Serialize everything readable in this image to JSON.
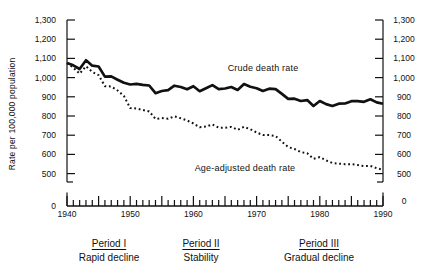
{
  "chart_data": {
    "type": "line",
    "title": "",
    "ylabel": "Rate per 100,000 population",
    "x_range": [
      1940,
      1990
    ],
    "years": [
      1940,
      1941,
      1942,
      1943,
      1944,
      1945,
      1946,
      1947,
      1948,
      1949,
      1950,
      1951,
      1952,
      1953,
      1954,
      1955,
      1956,
      1957,
      1958,
      1959,
      1960,
      1961,
      1962,
      1963,
      1964,
      1965,
      1966,
      1967,
      1968,
      1969,
      1970,
      1971,
      1972,
      1973,
      1974,
      1975,
      1976,
      1977,
      1978,
      1979,
      1980,
      1981,
      1982,
      1983,
      1984,
      1985,
      1986,
      1987,
      1988,
      1989,
      1990
    ],
    "series": [
      {
        "name": "Crude death rate",
        "style": "solid",
        "values": [
          1076,
          1064,
          1045,
          1090,
          1062,
          1058,
          1005,
          1006,
          989,
          973,
          964,
          967,
          962,
          959,
          919,
          930,
          935,
          958,
          951,
          939,
          955,
          929,
          945,
          961,
          940,
          943,
          951,
          936,
          966,
          952,
          945,
          930,
          942,
          940,
          915,
          889,
          890,
          878,
          883,
          852,
          878,
          862,
          852,
          864,
          865,
          877,
          877,
          874,
          887,
          871,
          864
        ]
      },
      {
        "name": "Age-adjusted death rate",
        "style": "dotted",
        "values": [
          1076,
          1052,
          1021,
          1059,
          1029,
          1013,
          955,
          954,
          933,
          904,
          841,
          839,
          831,
          824,
          785,
          789,
          786,
          798,
          788,
          777,
          761,
          741,
          745,
          756,
          739,
          739,
          743,
          728,
          744,
          731,
          714,
          701,
          701,
          696,
          666,
          638,
          628,
          612,
          606,
          577,
          586,
          569,
          555,
          552,
          549,
          549,
          545,
          539,
          540,
          528,
          520
        ]
      }
    ],
    "y_axis": {
      "tick_values": [
        500,
        600,
        700,
        800,
        900,
        1000,
        1100,
        1200,
        1300
      ],
      "tick_labels": [
        "500",
        "600",
        "700",
        "800",
        "900",
        "1,000",
        "1,100",
        "1,200",
        "1,300"
      ],
      "zero_label": "0",
      "axis_break_between": [
        0,
        500
      ],
      "ylim": [
        0,
        1300
      ],
      "grid": false,
      "duplicated_on_right": true
    },
    "x_axis": {
      "decade_label_years": [
        1940,
        1950,
        1960,
        1970,
        1980,
        1990
      ],
      "decade_labels": [
        "1940",
        "1950",
        "1960",
        "1970",
        "1980",
        "1990"
      ],
      "minor_tick_step_years": 1,
      "major_tick_step_years": 5
    },
    "colors": {
      "line": "#111111",
      "background": "#ffffff"
    }
  },
  "periods": [
    {
      "title": "Period I",
      "subtitle": "Rapid decline"
    },
    {
      "title": "Period II",
      "subtitle": "Stability"
    },
    {
      "title": "Period III",
      "subtitle": "Gradual decline"
    }
  ]
}
